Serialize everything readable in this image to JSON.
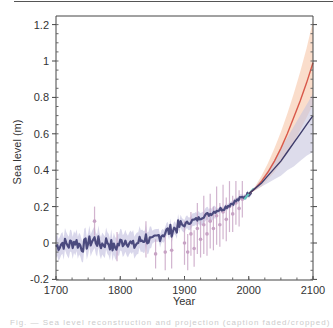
{
  "chart_data": {
    "type": "line",
    "title": "",
    "xlabel": "Year",
    "ylabel": "Sea  level (m)",
    "xlim": [
      1700,
      2100
    ],
    "ylim": [
      -0.2,
      1.25
    ],
    "x_ticks": [
      1700,
      1800,
      1900,
      2000,
      2100
    ],
    "x_tick_labels": [
      "1700",
      "1800",
      "1900",
      "2000",
      "2100"
    ],
    "y_ticks": [
      -0.2,
      0,
      0.2,
      0.4,
      0.6,
      0.8,
      1,
      1.2
    ],
    "y_tick_labels": [
      "-0.2",
      "0",
      "0.2",
      "0.4",
      "0.6",
      "0.8",
      "1",
      "1.2"
    ],
    "grid": false,
    "legend": null,
    "series": [
      {
        "name": "Reconstructed sea level (tide gauges, with uncertainty)",
        "color": "#4b4a7e",
        "band_color": "#b9b6da",
        "x": [
          1700,
          1710,
          1720,
          1730,
          1740,
          1750,
          1760,
          1770,
          1780,
          1790,
          1800,
          1810,
          1820,
          1830,
          1840,
          1850,
          1860,
          1870,
          1880,
          1890,
          1900,
          1910,
          1920,
          1930,
          1940,
          1950,
          1960,
          1970,
          1980,
          1990,
          2000,
          2005
        ],
        "y": [
          -0.02,
          0.0,
          -0.01,
          0.01,
          -0.02,
          0.0,
          0.02,
          -0.01,
          0.01,
          -0.03,
          0.0,
          0.02,
          -0.02,
          0.01,
          0.03,
          0.0,
          0.04,
          0.06,
          0.07,
          0.09,
          0.1,
          0.12,
          0.13,
          0.15,
          0.16,
          0.18,
          0.19,
          0.21,
          0.23,
          0.25,
          0.27,
          0.29
        ]
      },
      {
        "name": "Individual observations (with error bars)",
        "type": "errorbar",
        "color": "#c7a2c4",
        "x": [
          1760,
          1795,
          1840,
          1855,
          1870,
          1880,
          1900,
          1905,
          1910,
          1915,
          1920,
          1925,
          1930,
          1935,
          1940,
          1945,
          1950,
          1955,
          1960,
          1965,
          1970,
          1975,
          1980,
          1985,
          1990
        ],
        "y": [
          0.12,
          -0.02,
          0.02,
          -0.06,
          -0.05,
          -0.04,
          0.0,
          -0.05,
          0.05,
          -0.03,
          0.08,
          0.02,
          0.1,
          0.05,
          0.12,
          0.08,
          0.15,
          0.1,
          0.17,
          0.13,
          0.2,
          0.16,
          0.22,
          0.19,
          0.24
        ],
        "err": [
          0.08,
          0.08,
          0.1,
          0.08,
          0.1,
          0.1,
          0.12,
          0.1,
          0.12,
          0.1,
          0.14,
          0.1,
          0.16,
          0.12,
          0.15,
          0.12,
          0.16,
          0.12,
          0.15,
          0.12,
          0.14,
          0.1,
          0.12,
          0.1,
          0.1
        ]
      },
      {
        "name": "Satellite altimetry",
        "color": "#5fc7c0",
        "x": [
          1993,
          2000,
          2008
        ],
        "y": [
          0.24,
          0.27,
          0.3
        ]
      },
      {
        "name": "Projection (higher scenario)",
        "color": "#d9594a",
        "band_color": "#f6c7a8",
        "x": [
          2000,
          2010,
          2020,
          2030,
          2040,
          2050,
          2060,
          2070,
          2080,
          2090,
          2100
        ],
        "y": [
          0.27,
          0.3,
          0.34,
          0.39,
          0.45,
          0.52,
          0.6,
          0.69,
          0.78,
          0.88,
          0.99
        ],
        "lower": [
          0.27,
          0.29,
          0.31,
          0.35,
          0.39,
          0.44,
          0.49,
          0.55,
          0.62,
          0.69,
          0.76
        ],
        "upper": [
          0.27,
          0.31,
          0.37,
          0.44,
          0.52,
          0.61,
          0.71,
          0.82,
          0.94,
          1.07,
          1.22
        ]
      },
      {
        "name": "Projection (lower scenario)",
        "color": "#3e3c6b",
        "band_color": "#c7c5de",
        "x": [
          2000,
          2010,
          2020,
          2030,
          2040,
          2050,
          2060,
          2070,
          2080,
          2090,
          2100
        ],
        "y": [
          0.27,
          0.3,
          0.33,
          0.37,
          0.41,
          0.45,
          0.5,
          0.55,
          0.6,
          0.65,
          0.7
        ],
        "lower": [
          0.27,
          0.29,
          0.31,
          0.33,
          0.35,
          0.37,
          0.4,
          0.42,
          0.45,
          0.48,
          0.5
        ],
        "upper": [
          0.27,
          0.31,
          0.35,
          0.4,
          0.46,
          0.52,
          0.58,
          0.64,
          0.7,
          0.76,
          0.82
        ]
      }
    ]
  },
  "caption": {
    "text": "Fig. — Sea level reconstruction and projection (caption faded/cropped)"
  }
}
